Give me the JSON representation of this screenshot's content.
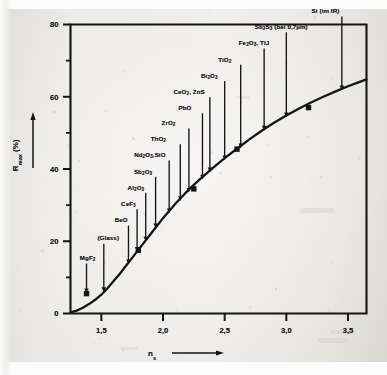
{
  "figure": {
    "caption_absent": true
  },
  "axes": {
    "y_label_text": "R",
    "y_label_sub": "max",
    "y_label_unit": " (%)",
    "x_label_text": "n",
    "x_label_sub": "s",
    "y_ticks": [
      "0",
      "20",
      "40",
      "60",
      "80"
    ],
    "x_ticks": [
      "1,5",
      "2,0",
      "2,5",
      "3,0",
      "3,5"
    ]
  },
  "chart_data": {
    "type": "line",
    "title": "",
    "xlabel": "n_s",
    "ylabel": "R_max (%)",
    "xlim": [
      1.25,
      3.65
    ],
    "ylim": [
      0,
      80
    ],
    "grid": false,
    "legend": "none",
    "x_tick_values": [
      1.5,
      2.0,
      2.5,
      3.0,
      3.5
    ],
    "y_tick_values": [
      0,
      20,
      40,
      60,
      80
    ],
    "y_minor_tick_values": [
      10,
      30,
      50,
      70
    ],
    "series": [
      {
        "name": "R_max vs n_s",
        "x": [
          1.25,
          1.3,
          1.35,
          1.4,
          1.45,
          1.5,
          1.55,
          1.6,
          1.65,
          1.7,
          1.75,
          1.8,
          1.9,
          2.0,
          2.1,
          2.2,
          2.3,
          2.4,
          2.5,
          2.6,
          2.7,
          2.8,
          2.9,
          3.0,
          3.1,
          3.2,
          3.3,
          3.4,
          3.5,
          3.6,
          3.65
        ],
        "y": [
          0.3,
          0.8,
          1.6,
          2.6,
          3.8,
          5.2,
          7.0,
          9.0,
          11.0,
          13.2,
          15.4,
          17.6,
          22.0,
          26.4,
          30.4,
          34.0,
          37.2,
          40.2,
          43.0,
          45.6,
          48.2,
          50.6,
          52.8,
          54.8,
          56.7,
          58.4,
          60.0,
          61.5,
          62.9,
          64.2,
          64.8
        ]
      }
    ],
    "markers": [
      {
        "x": 1.38,
        "y": 5.5
      },
      {
        "x": 1.8,
        "y": 17.5
      },
      {
        "x": 2.25,
        "y": 34.5
      },
      {
        "x": 2.6,
        "y": 45.5
      },
      {
        "x": 3.18,
        "y": 57.0
      }
    ],
    "annotations": [
      {
        "label": "MgF2",
        "html": "MgF<sub>2</sub>",
        "x": 1.38,
        "y": 5.5,
        "label_x": 1.325,
        "label_y": 15.0
      },
      {
        "label": "(Glass)",
        "html": "(Glass)",
        "x": 1.52,
        "y": 5.8,
        "label_x": 1.468,
        "label_y": 20.5
      },
      {
        "label": "BeO",
        "html": "BeO",
        "x": 1.72,
        "y": 13.5,
        "label_x": 1.608,
        "label_y": 25.5
      },
      {
        "label": "CeF3",
        "html": "CeF<sub>3</sub>",
        "x": 1.79,
        "y": 17.0,
        "label_x": 1.66,
        "label_y": 30.0
      },
      {
        "label": "Al2O3",
        "html": "Al<sub>2</sub>O<sub>3</sub>",
        "x": 1.86,
        "y": 19.8,
        "label_x": 1.713,
        "label_y": 34.6
      },
      {
        "label": "Sb2O3",
        "html": "Sb<sub>2</sub>O<sub>3</sub>",
        "x": 1.94,
        "y": 23.5,
        "label_x": 1.764,
        "label_y": 39.0
      },
      {
        "label": "Nd2O3,SiO",
        "html": "Nd<sub>2</sub>O<sub>3</sub>,SiO",
        "x": 2.05,
        "y": 27.6,
        "label_x": 1.766,
        "label_y": 43.5
      },
      {
        "label": "ThO2",
        "html": "ThO<sub>2</sub>",
        "x": 2.14,
        "y": 31.0,
        "label_x": 1.9,
        "label_y": 48.0
      },
      {
        "label": "ZrO2",
        "html": "ZrO<sub>2</sub>",
        "x": 2.21,
        "y": 33.3,
        "label_x": 1.988,
        "label_y": 52.4
      },
      {
        "label": "PbO",
        "html": "PbO",
        "x": 2.32,
        "y": 37.0,
        "label_x": 2.125,
        "label_y": 56.6
      },
      {
        "label": "CeO2,ZnS",
        "html": "CeO<sub>2</sub>, ZnS",
        "x": 2.38,
        "y": 39.0,
        "label_x": 2.085,
        "label_y": 61.0
      },
      {
        "label": "Bi2O3",
        "html": "Bi<sub>2</sub>O<sub>3</sub>",
        "x": 2.5,
        "y": 42.3,
        "label_x": 2.308,
        "label_y": 65.5
      },
      {
        "label": "TiO2",
        "html": "TiO<sub>2</sub>",
        "x": 2.63,
        "y": 45.6,
        "label_x": 2.448,
        "label_y": 70.0
      },
      {
        "label": "Fe2O3,TlJ",
        "html": "Fe<sub>2</sub>O<sub>3</sub>, TlJ",
        "x": 2.82,
        "y": 50.5,
        "label_x": 2.614,
        "label_y": 74.5
      },
      {
        "label": "Sb2S3 (bei 0,7 um)",
        "html": "Sb<sub>2</sub>S<sub>3</sub> (bei 0,7&#181;m)",
        "x": 3.0,
        "y": 54.2,
        "label_x": 2.744,
        "label_y": 79.0
      },
      {
        "label": "Si (im IR)",
        "html": "Si (im IR)",
        "x": 3.45,
        "y": 61.7,
        "label_x": 3.205,
        "label_y": 83.4
      }
    ]
  },
  "colors": {
    "curve": "#141417",
    "frame": "#141417",
    "text": "#16161a",
    "paper": "#e8e6e2"
  }
}
